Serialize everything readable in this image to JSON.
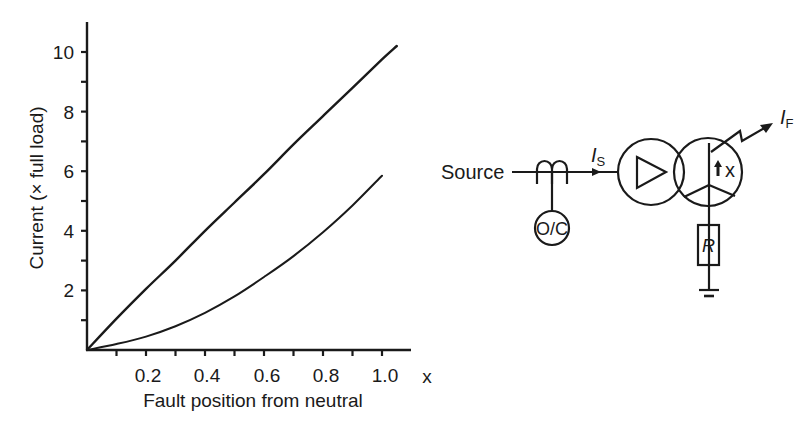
{
  "figure": {
    "chart": {
      "y_axis_title": "Current (× full load)",
      "x_axis_title": "Fault position from neutral",
      "x_variable_label": "x",
      "y_tick_labels": [
        "2",
        "4",
        "6",
        "8",
        "10"
      ],
      "x_tick_labels": [
        "0.2",
        "0.4",
        "0.6",
        "0.8",
        "1.0"
      ]
    },
    "diagram": {
      "source_label": "Source",
      "relay_label": "O/C",
      "source_current_symbol": "I",
      "source_current_subscript": "S",
      "fault_current_symbol": "I",
      "fault_current_subscript": "F",
      "fault_position_label": "x",
      "resistor_label": "R",
      "components": [
        "current-transformer",
        "overcurrent-relay",
        "delta-winding",
        "star-winding",
        "neutral-earthing-resistor",
        "earth"
      ]
    }
  },
  "chart_data": {
    "type": "line",
    "title": "",
    "xlabel": "Fault position from neutral",
    "ylabel": "Current (× full load)",
    "xlim": [
      0,
      1.1
    ],
    "ylim": [
      0,
      11
    ],
    "x_ticks": [
      0.1,
      0.2,
      0.3,
      0.4,
      0.5,
      0.6,
      0.7,
      0.8,
      0.9,
      1.0
    ],
    "x_tick_labels": [
      "0.2",
      "0.4",
      "0.6",
      "0.8",
      "1.0"
    ],
    "y_ticks": [
      1,
      2,
      3,
      4,
      5,
      6,
      7,
      8,
      9,
      10
    ],
    "y_tick_labels": [
      "2",
      "4",
      "6",
      "8",
      "10"
    ],
    "grid": false,
    "legend": null,
    "series": [
      {
        "name": "I_F (fault current)",
        "x": [
          0,
          0.1,
          0.2,
          0.3,
          0.4,
          0.5,
          0.6,
          0.7,
          0.8,
          0.9,
          1.0,
          1.05
        ],
        "values": [
          0,
          1.05,
          2.05,
          3.0,
          4.0,
          4.95,
          5.9,
          6.9,
          7.85,
          8.8,
          9.75,
          10.2
        ]
      },
      {
        "name": "I_S (source current)",
        "x": [
          0,
          0.1,
          0.2,
          0.3,
          0.4,
          0.5,
          0.6,
          0.7,
          0.8,
          0.9,
          1.0
        ],
        "values": [
          0,
          0.2,
          0.45,
          0.8,
          1.25,
          1.8,
          2.45,
          3.15,
          3.95,
          4.85,
          5.85
        ]
      }
    ]
  }
}
